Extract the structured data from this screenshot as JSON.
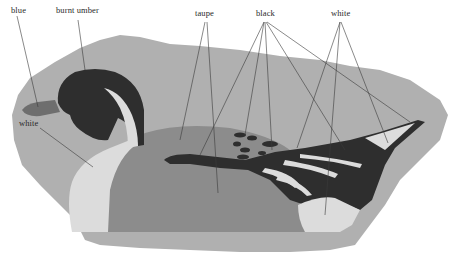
{
  "figure": {
    "colors": {
      "background_blob": "#b0b0b0",
      "taupe": "#8c8c8c",
      "black": "#2e2e2e",
      "white": "#dcdcdc",
      "bill_blue": "#6e6e6e",
      "leader_line": "#3a3a3a"
    }
  },
  "labels": [
    {
      "id": "blue",
      "text": "blue",
      "x": 11,
      "y": 7
    },
    {
      "id": "burnt-umber",
      "text": "burnt umber",
      "x": 56,
      "y": 7
    },
    {
      "id": "taupe",
      "text": "taupe",
      "x": 196,
      "y": 10
    },
    {
      "id": "black",
      "text": "black",
      "x": 256,
      "y": 10
    },
    {
      "id": "white-tail",
      "text": "white",
      "x": 331,
      "y": 10
    },
    {
      "id": "white-breast",
      "text": "white",
      "x": 19,
      "y": 119
    }
  ]
}
